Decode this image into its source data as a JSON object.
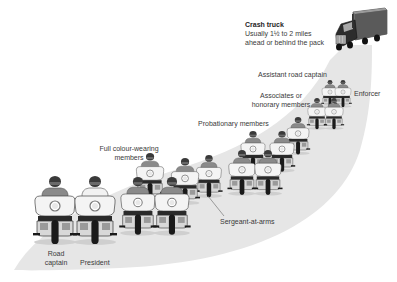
{
  "diagram": {
    "colors": {
      "background": "#ffffff",
      "road": "#e6e6e6",
      "rider_shirt": "#8a8a8a",
      "president_shirt": "#f2f2f2",
      "helmet": "#3a3a3a",
      "fairing": "#f4f4f4",
      "tire": "#1a1a1a",
      "label_text": "#3a3a3a"
    },
    "labels": {
      "crash_truck": {
        "title": "Crash truck",
        "line1": "Usually 1½ to 2 miles",
        "line2": "ahead or behind the pack"
      },
      "assistant_road_captain": "Assistant road captain",
      "enforcer": "Enforcer",
      "associates": {
        "line1": "Associates or",
        "line2": "honorary members"
      },
      "probationary": "Probationary members",
      "full_colour": {
        "line1": "Full colour-wearing",
        "line2": "members"
      },
      "sergeant_at_arms": "Sergeant-at-arms",
      "road_captain": {
        "line1": "Road",
        "line2": "captain"
      },
      "president": "President"
    },
    "riders": [
      {
        "role": "road-captain",
        "x": 55,
        "y": 178,
        "scale": 1.0,
        "shirt": "dark"
      },
      {
        "role": "president",
        "x": 95,
        "y": 178,
        "scale": 1.0,
        "shirt": "light"
      },
      {
        "role": "full-colour-member",
        "x": 150,
        "y": 155,
        "scale": 0.68,
        "shirt": "dark"
      },
      {
        "role": "full-colour-member",
        "x": 185,
        "y": 160,
        "scale": 0.68,
        "shirt": "dark"
      },
      {
        "role": "sergeant-at-arms",
        "x": 209,
        "y": 157,
        "scale": 0.62,
        "shirt": "dark"
      },
      {
        "role": "full-colour-member",
        "x": 138,
        "y": 178,
        "scale": 0.85,
        "shirt": "dark"
      },
      {
        "role": "full-colour-member",
        "x": 172,
        "y": 178,
        "scale": 0.85,
        "shirt": "dark"
      },
      {
        "role": "probationary-member",
        "x": 298,
        "y": 117,
        "scale": 0.55,
        "shirt": "dark"
      },
      {
        "role": "probationary-member",
        "x": 253,
        "y": 131,
        "scale": 0.6,
        "shirt": "dark"
      },
      {
        "role": "probationary-member",
        "x": 282,
        "y": 131,
        "scale": 0.6,
        "shirt": "dark"
      },
      {
        "role": "probationary-member",
        "x": 242,
        "y": 152,
        "scale": 0.66,
        "shirt": "dark"
      },
      {
        "role": "probationary-member",
        "x": 268,
        "y": 152,
        "scale": 0.66,
        "shirt": "dark"
      },
      {
        "role": "associate-member",
        "x": 317,
        "y": 98,
        "scale": 0.46,
        "shirt": "dark"
      },
      {
        "role": "associate-member",
        "x": 334,
        "y": 98,
        "scale": 0.46,
        "shirt": "dark"
      },
      {
        "role": "assistant-road-captain",
        "x": 330,
        "y": 80,
        "scale": 0.4,
        "shirt": "dark"
      },
      {
        "role": "enforcer",
        "x": 343,
        "y": 80,
        "scale": 0.4,
        "shirt": "dark"
      }
    ]
  }
}
